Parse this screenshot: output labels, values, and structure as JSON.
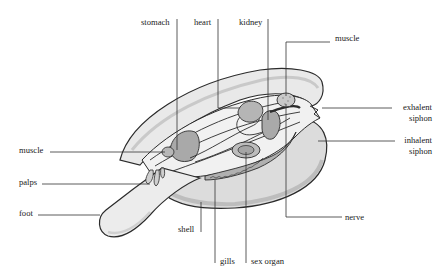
{
  "diagram": {
    "colors": {
      "outline": "#2b2b2b",
      "shell_fill": "#e9e9e9",
      "shell_shadow": "#d2d2d2",
      "mantle_fill": "#f1f1f1",
      "organ_fill": "#a9a9a9",
      "organ_light": "#c4c4c4",
      "leader_line": "#333333",
      "label_text": "#1a1a1a"
    },
    "labels": {
      "stomach": "stomach",
      "heart": "heart",
      "kidney": "kidney",
      "muscle_top": "muscle",
      "exhalent_line1": "exhalent",
      "exhalent_line2": "siphon",
      "inhalent_line1": "inhalent",
      "inhalent_line2": "siphon",
      "muscle_left": "muscle",
      "palps": "palps",
      "foot": "foot",
      "shell": "shell",
      "gills": "gills",
      "sex_organ": "sex organ",
      "nerve": "nerve"
    }
  }
}
